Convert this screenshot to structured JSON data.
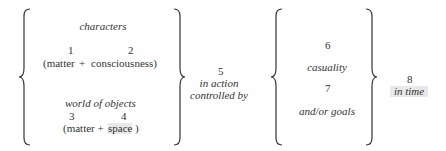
{
  "left_group": {
    "characters_label": "characters",
    "num1": "1",
    "num2": "2",
    "matter1": "(matter",
    "plus1": "+",
    "consciousness": "consciousness)",
    "world_label": "world of objects",
    "num3": "3",
    "num4": "4",
    "matter2": "(matter +",
    "space": "space",
    "close_paren": ")"
  },
  "middle": {
    "num5": "5",
    "line1": "in action",
    "line2": "controlled by"
  },
  "right_group": {
    "num6": "6",
    "casuality": "casuality",
    "num7": "7",
    "goals": "and/or goals"
  },
  "end": {
    "num8": "8",
    "in_time": "in time"
  }
}
